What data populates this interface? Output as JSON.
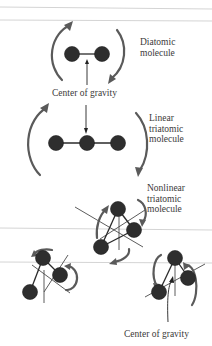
{
  "figure": {
    "labels": {
      "diatomic": "Diatomic\nmolecule",
      "center_top": "Center of gravity",
      "linear": "Linear\ntriatomic\nmolecule",
      "nonlinear": "Nonlinear\ntriatomic\nmolecule",
      "center_bottom": "Center of gravity"
    },
    "colors": {
      "atom": "#2e2e2e",
      "rotation_arrow": "#5a5a5a",
      "text": "#3a3a3a",
      "scan_line": "#d4d4d4"
    },
    "molecules": [
      {
        "name": "diatomic",
        "atoms": 2
      },
      {
        "name": "linear-triatomic",
        "atoms": 3
      },
      {
        "name": "nonlinear-triatomic",
        "atoms": 3,
        "views": 3
      }
    ]
  }
}
